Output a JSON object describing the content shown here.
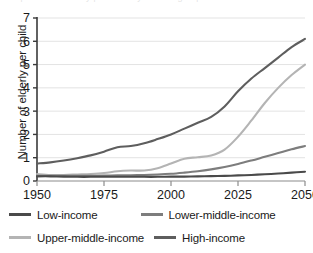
{
  "figure": {
    "cropped_title_artifact": "Proportion of elderly per child by income group",
    "ylabel": "Number of elderly per child"
  },
  "chart_data": {
    "type": "line",
    "title": "",
    "xlabel": "",
    "ylabel": "Number of elderly per child",
    "xlim": [
      1950,
      2050
    ],
    "ylim": [
      0,
      7
    ],
    "xticks": [
      1950,
      1975,
      2000,
      2025,
      2050
    ],
    "yticks": [
      0,
      1,
      2,
      3,
      4,
      5,
      6,
      7
    ],
    "grid": "horizontal",
    "legend_position": "below",
    "x": [
      1950,
      1955,
      1960,
      1965,
      1970,
      1975,
      1980,
      1985,
      1990,
      1995,
      2000,
      2005,
      2010,
      2015,
      2020,
      2025,
      2030,
      2035,
      2040,
      2045,
      2050
    ],
    "series": [
      {
        "name": "Low-income",
        "color": "#4a4a4a",
        "values": [
          0.2,
          0.2,
          0.19,
          0.18,
          0.18,
          0.18,
          0.18,
          0.18,
          0.18,
          0.18,
          0.19,
          0.19,
          0.2,
          0.21,
          0.22,
          0.24,
          0.26,
          0.29,
          0.32,
          0.36,
          0.4
        ]
      },
      {
        "name": "Lower-middle-income",
        "color": "#7d7d7d",
        "values": [
          0.22,
          0.22,
          0.22,
          0.22,
          0.22,
          0.23,
          0.24,
          0.25,
          0.26,
          0.28,
          0.31,
          0.36,
          0.42,
          0.5,
          0.6,
          0.73,
          0.88,
          1.04,
          1.2,
          1.36,
          1.5
        ]
      },
      {
        "name": "Upper-middle-income",
        "color": "#b4b4b4",
        "values": [
          0.3,
          0.26,
          0.26,
          0.28,
          0.3,
          0.34,
          0.42,
          0.45,
          0.45,
          0.55,
          0.75,
          0.96,
          1.02,
          1.1,
          1.35,
          1.9,
          2.6,
          3.35,
          4.0,
          4.55,
          5.0
        ]
      },
      {
        "name": "High-income",
        "color": "#5e5e5e",
        "values": [
          0.75,
          0.8,
          0.88,
          0.98,
          1.1,
          1.26,
          1.45,
          1.5,
          1.62,
          1.8,
          2.0,
          2.25,
          2.5,
          2.75,
          3.2,
          3.85,
          4.4,
          4.85,
          5.3,
          5.75,
          6.1
        ]
      }
    ]
  },
  "legend": {
    "items": [
      {
        "label": "Low-income",
        "color": "#4a4a4a"
      },
      {
        "label": "Lower-middle-income",
        "color": "#7d7d7d"
      },
      {
        "label": "Upper-middle-income",
        "color": "#b4b4b4"
      },
      {
        "label": "High-income",
        "color": "#5e5e5e"
      }
    ]
  },
  "axis": {
    "x_tick_labels": [
      "1950",
      "1975",
      "2000",
      "2025",
      "2050"
    ],
    "y_tick_labels": [
      "0",
      "1",
      "2",
      "3",
      "4",
      "5",
      "6",
      "7"
    ]
  }
}
